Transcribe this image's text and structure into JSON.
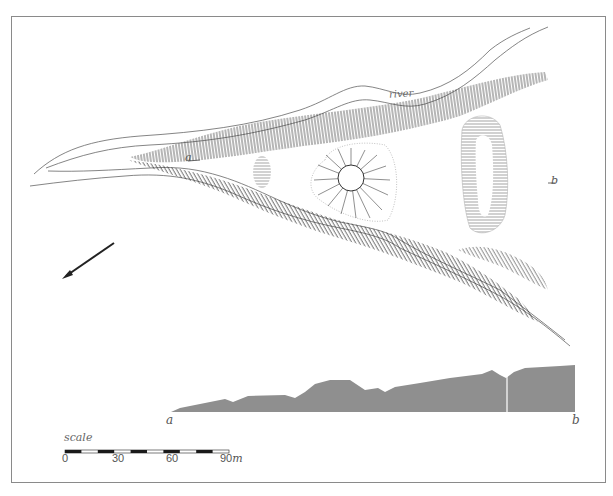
{
  "map": {
    "title_labels": {
      "river": "river",
      "section_start_plan": "a",
      "section_end_plan": "b"
    },
    "features": [
      {
        "name": "river-channel",
        "type": "watercourse"
      },
      {
        "name": "northern-ridge-bank",
        "type": "hachured-slope"
      },
      {
        "name": "southern-ridge-bank",
        "type": "hachured-slope"
      },
      {
        "name": "small-rampart",
        "type": "hachured-mound"
      },
      {
        "name": "circular-mound",
        "type": "ring-mound"
      },
      {
        "name": "elongated-enclosure",
        "type": "hachured-enclosure"
      },
      {
        "name": "south-east-bank",
        "type": "hachured-slope"
      }
    ],
    "north_arrow": {
      "direction": "south-west"
    },
    "profile": {
      "start_label": "a",
      "end_label": "b",
      "fill_color": "#8f8f8f"
    },
    "scale": {
      "title": "scale",
      "ticks": [
        "0",
        "30",
        "60",
        "90"
      ],
      "unit": "m",
      "segment_colors": [
        "#1a1a1a",
        "#ffffff"
      ]
    },
    "colors": {
      "line": "#555555",
      "hachure": "#3a3a3a",
      "frame": "#8a8a8a"
    }
  }
}
